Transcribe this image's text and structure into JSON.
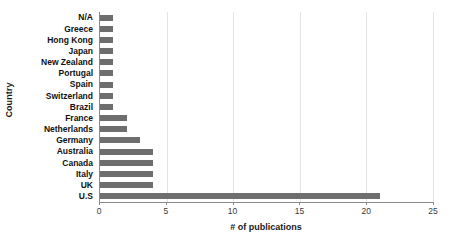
{
  "chart_data": {
    "type": "bar",
    "orientation": "horizontal",
    "title": "",
    "xlabel": "# of publications",
    "ylabel": "Country",
    "categories": [
      "N/A",
      "Greece",
      "Hong Kong",
      "Japan",
      "New Zealand",
      "Portugal",
      "Spain",
      "Switzerland",
      "Brazil",
      "France",
      "Netherlands",
      "Germany",
      "Australia",
      "Canada",
      "Italy",
      "UK",
      "U.S"
    ],
    "values": [
      1,
      1,
      1,
      1,
      1,
      1,
      1,
      1,
      1,
      2,
      2,
      3,
      4,
      4,
      4,
      4,
      21
    ],
    "xlim": [
      0,
      25
    ],
    "xticks": [
      0,
      5,
      10,
      15,
      20,
      25
    ],
    "xtick_labels": [
      "0",
      "5",
      "10",
      "15",
      "20",
      "25"
    ],
    "grid": true,
    "grid_axis": "x",
    "legend": false,
    "bar_color": "#6e6e6e",
    "gridline_color": "#e4e4e4",
    "axis_color": "#8a8a8a"
  }
}
